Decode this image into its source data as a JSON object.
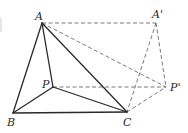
{
  "diagram": {
    "points": {
      "A": {
        "label": "A",
        "x": 42,
        "y": 23,
        "lx": 35,
        "ly": 20
      },
      "B": {
        "label": "B",
        "x": 13,
        "y": 113,
        "lx": 7,
        "ly": 126
      },
      "C": {
        "label": "C",
        "x": 127,
        "y": 112,
        "lx": 123,
        "ly": 126
      },
      "P": {
        "label": "P",
        "x": 53,
        "y": 87,
        "lx": 42,
        "ly": 88
      },
      "A2": {
        "label": "A'",
        "x": 156,
        "y": 23,
        "lx": 152,
        "ly": 18
      },
      "P2": {
        "label": "P'",
        "x": 166,
        "y": 87,
        "lx": 170,
        "ly": 91
      }
    },
    "solid_segments": [
      [
        "A",
        "B"
      ],
      [
        "A",
        "C"
      ],
      [
        "A",
        "P"
      ],
      [
        "B",
        "C"
      ],
      [
        "B",
        "P"
      ],
      [
        "P",
        "C"
      ]
    ],
    "dashed_segments": [
      [
        "A",
        "A2"
      ],
      [
        "A",
        "P2"
      ],
      [
        "P",
        "P2"
      ],
      [
        "A2",
        "C"
      ],
      [
        "A2",
        "P2"
      ],
      [
        "C",
        "P2"
      ]
    ],
    "colors": {
      "solid_stroke": "#2a2a2a",
      "dashed_stroke": "#6a6a6a",
      "background": "#ffffff"
    }
  }
}
